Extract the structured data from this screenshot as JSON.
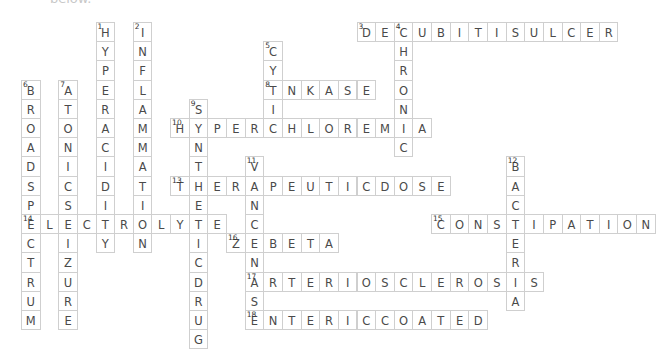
{
  "caption": "below.",
  "grid": {
    "origin_x": 21,
    "origin_y": 22,
    "cell_w": 18.64,
    "cell_h": 19.2
  },
  "words": [
    {
      "num": 1,
      "dir": "down",
      "row": 0,
      "col": 4,
      "answer": "HYPERACIDITY"
    },
    {
      "num": 2,
      "dir": "down",
      "row": 0,
      "col": 6,
      "answer": "INFLAMMATION"
    },
    {
      "num": 3,
      "dir": "across",
      "row": 0,
      "col": 18,
      "answer": "DECUBITISULCER"
    },
    {
      "num": 4,
      "dir": "down",
      "row": 0,
      "col": 20,
      "answer": "CHRONIC"
    },
    {
      "num": 5,
      "dir": "down",
      "row": 1,
      "col": 13,
      "answer": "CYTIC"
    },
    {
      "num": 6,
      "dir": "down",
      "row": 3,
      "col": 0,
      "answer": "BROADSPECTRUM"
    },
    {
      "num": 7,
      "dir": "down",
      "row": 3,
      "col": 2,
      "answer": "ATONICSEIZURE"
    },
    {
      "num": 8,
      "dir": "across",
      "row": 3,
      "col": 13,
      "answer": "TNKASE"
    },
    {
      "num": 9,
      "dir": "down",
      "row": 4,
      "col": 9,
      "answer": "SYNTHETICDRUG"
    },
    {
      "num": 10,
      "dir": "across",
      "row": 5,
      "col": 8,
      "answer": "HYPERCHLOREMIA"
    },
    {
      "num": 11,
      "dir": "down",
      "row": 7,
      "col": 12,
      "answer": "VANCENASE"
    },
    {
      "num": 12,
      "dir": "down",
      "row": 7,
      "col": 26,
      "answer": "BACTERIA"
    },
    {
      "num": 13,
      "dir": "across",
      "row": 8,
      "col": 8,
      "answer": "THERAPEUTICDOSE"
    },
    {
      "num": 14,
      "dir": "across",
      "row": 10,
      "col": 0,
      "answer": "ELECTROLYTE"
    },
    {
      "num": 15,
      "dir": "across",
      "row": 10,
      "col": 22,
      "answer": "CONSTIPATION"
    },
    {
      "num": 16,
      "dir": "across",
      "row": 11,
      "col": 11,
      "answer": "ZEBETA"
    },
    {
      "num": 17,
      "dir": "across",
      "row": 13,
      "col": 12,
      "answer": "ARTERIOSCLEROSIS"
    },
    {
      "num": 18,
      "dir": "across",
      "row": 15,
      "col": 12,
      "answer": "ENTERICCOATED"
    }
  ]
}
